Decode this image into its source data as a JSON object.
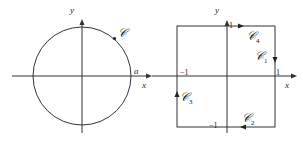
{
  "left_diagram": {
    "axis_x_label": "x",
    "axis_y_label": "y",
    "curve_label": "𝒞",
    "radius_label": "a"
  },
  "right_diagram": {
    "axis_x_label": "x",
    "axis_y_label": "y",
    "tick_x_pos": "1",
    "tick_x_neg": "−1",
    "tick_y_pos": "1",
    "tick_y_neg": "−1",
    "segments": [
      {
        "label": "𝒞",
        "sub": "1"
      },
      {
        "label": "𝒞",
        "sub": "2"
      },
      {
        "label": "𝒞",
        "sub": "3"
      },
      {
        "label": "𝒞",
        "sub": "4"
      }
    ]
  },
  "colors": {
    "line": "#333333",
    "text": "#222222",
    "background": "#ffffff"
  }
}
